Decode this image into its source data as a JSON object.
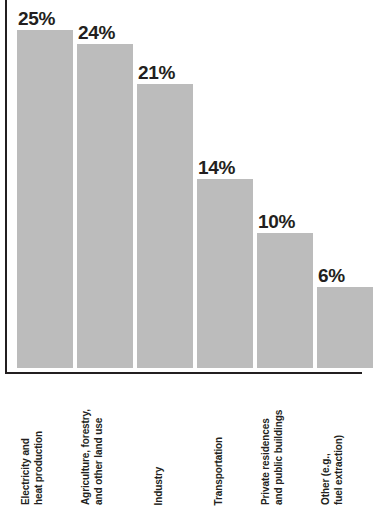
{
  "chart_data": {
    "type": "bar",
    "title": "",
    "subtitle": "",
    "xlabel": "",
    "ylabel": "",
    "ylim": [
      0,
      27
    ],
    "grid": false,
    "legend": "none",
    "orientation": "vertical",
    "value_suffix": "%",
    "categories": [
      "Electricity and heat production",
      "Agriculture, forestry, and other land use",
      "Industry",
      "Transportation",
      "Private residences and public buildings",
      "Other (e.g., fuel extraction)"
    ],
    "values": [
      25,
      24,
      21,
      14,
      10,
      6
    ],
    "value_labels": [
      "25%",
      "24%",
      "21%",
      "14%",
      "10%",
      "6%"
    ],
    "bars": [
      {
        "value": 25,
        "value_label": "25%",
        "category": "Electricity and heat production",
        "category_lines": [
          "Electricity and",
          "heat production"
        ]
      },
      {
        "value": 24,
        "value_label": "24%",
        "category": "Agriculture, forestry, and other land use",
        "category_lines": [
          "Agriculture, forestry,",
          "and other land use"
        ]
      },
      {
        "value": 21,
        "value_label": "21%",
        "category": "Industry",
        "category_lines": [
          "Industry",
          ""
        ]
      },
      {
        "value": 14,
        "value_label": "14%",
        "category": "Transportation",
        "category_lines": [
          "Transportation",
          ""
        ]
      },
      {
        "value": 10,
        "value_label": "10%",
        "category": "Private residences and public buildings",
        "category_lines": [
          "Private residences",
          "and public buildings"
        ]
      },
      {
        "value": 6,
        "value_label": "6%",
        "category": "Other (e.g., fuel extraction)",
        "category_lines": [
          "Other (e.g.,",
          "fuel extraction)"
        ]
      }
    ],
    "colors": {
      "bar_fill": "#bcbcbc",
      "axis": "#231f20",
      "label_text": "#231f20",
      "background": "#ffffff"
    }
  }
}
